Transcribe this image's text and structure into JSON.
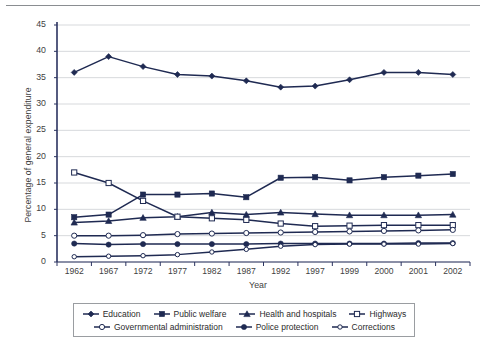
{
  "chart_data": {
    "type": "line",
    "title": "",
    "xlabel": "Year",
    "ylabel": "Percentage of general expenditure",
    "categories": [
      "1962",
      "1967",
      "1972",
      "1977",
      "1982",
      "1987",
      "1992",
      "1997",
      "1999",
      "2000",
      "2001",
      "2002"
    ],
    "ylim": [
      0,
      45
    ],
    "yticks": [
      0,
      5,
      10,
      15,
      20,
      25,
      30,
      35,
      40,
      45
    ],
    "grid": true,
    "legend_position": "bottom",
    "series": [
      {
        "name": "Education",
        "marker": "filled-diamond",
        "color": "#1f2a52",
        "values": [
          36.0,
          39.0,
          37.1,
          35.6,
          35.3,
          34.4,
          33.2,
          33.4,
          34.6,
          36.0,
          36.0,
          35.6
        ]
      },
      {
        "name": "Public welfare",
        "marker": "filled-square",
        "color": "#1f2a52",
        "values": [
          8.5,
          9.0,
          12.8,
          12.8,
          13.0,
          12.3,
          16.0,
          16.1,
          15.5,
          16.1,
          16.4,
          16.7
        ]
      },
      {
        "name": "Health and hospitals",
        "marker": "filled-triangle",
        "color": "#1f2a52",
        "values": [
          7.5,
          7.8,
          8.4,
          8.6,
          9.4,
          9.0,
          9.4,
          9.1,
          8.9,
          8.9,
          8.9,
          9.0
        ]
      },
      {
        "name": "Highways",
        "marker": "hollow-square",
        "color": "#1f2a52",
        "values": [
          17.0,
          15.0,
          11.6,
          8.6,
          8.3,
          8.0,
          7.3,
          6.8,
          6.9,
          7.0,
          7.0,
          7.0
        ]
      },
      {
        "name": "Governmental administration",
        "marker": "hollow-circle",
        "color": "#1f2a52",
        "values": [
          5.0,
          5.0,
          5.1,
          5.3,
          5.4,
          5.5,
          5.6,
          5.7,
          5.8,
          5.9,
          6.0,
          6.1
        ]
      },
      {
        "name": "Police protection",
        "marker": "filled-circle",
        "color": "#1f2a52",
        "values": [
          3.5,
          3.3,
          3.4,
          3.4,
          3.4,
          3.4,
          3.5,
          3.5,
          3.5,
          3.5,
          3.6,
          3.6
        ]
      },
      {
        "name": "Corrections",
        "marker": "hollow-circle-small",
        "color": "#1f2a52",
        "values": [
          1.0,
          1.1,
          1.2,
          1.4,
          1.9,
          2.4,
          3.0,
          3.3,
          3.4,
          3.4,
          3.4,
          3.5
        ]
      }
    ]
  },
  "axis": {
    "y_label": "Percentage of general expenditure",
    "x_label": "Year"
  },
  "legend": {
    "items": [
      {
        "label": "Education"
      },
      {
        "label": "Public welfare"
      },
      {
        "label": "Health and hospitals"
      },
      {
        "label": "Highways"
      },
      {
        "label": "Governmental administration"
      },
      {
        "label": "Police protection"
      },
      {
        "label": "Corrections"
      }
    ]
  },
  "colors": {
    "series": "#1f2a52",
    "grid": "#d7d9dc",
    "axis": "#2b3360",
    "rule": "#8a8d91"
  }
}
